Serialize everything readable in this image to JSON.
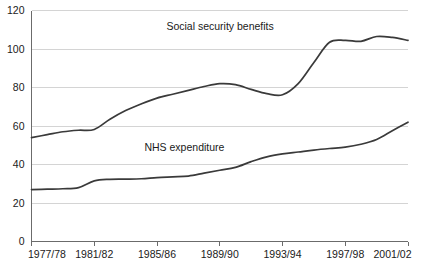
{
  "chart_data": {
    "type": "line",
    "title": "",
    "subtitle": "",
    "xlabel": "",
    "ylabel": "",
    "grid": "horizontal",
    "legend_position": "inline-annotation",
    "ylim": [
      0,
      120
    ],
    "yticks": [
      0,
      20,
      40,
      60,
      80,
      100,
      120
    ],
    "ytick_labels": [
      "0",
      "20",
      "40",
      "60",
      "80",
      "100",
      "120"
    ],
    "x": [
      "1977/78",
      "1978/79",
      "1979/80",
      "1980/81",
      "1981/82",
      "1982/83",
      "1983/84",
      "1984/85",
      "1985/86",
      "1986/87",
      "1987/88",
      "1988/89",
      "1989/90",
      "1990/91",
      "1991/92",
      "1992/93",
      "1993/94",
      "1994/95",
      "1995/96",
      "1996/97",
      "1997/98",
      "1998/99",
      "1999/00",
      "2000/01",
      "2001/02"
    ],
    "xtick_labels": [
      "1977/78",
      "1981/82",
      "1985/86",
      "1989/90",
      "1993/94",
      "1997/98",
      "2001/02"
    ],
    "xtick_indices": [
      0,
      4,
      8,
      12,
      16,
      20,
      24
    ],
    "series": [
      {
        "name": "Social security benefits",
        "label_x_index": 8.6,
        "label_y_value": 112,
        "color": "#3a3a3a",
        "values": [
          54,
          55.5,
          57,
          57.8,
          58.2,
          63.5,
          68,
          71.5,
          74.5,
          76.5,
          78.5,
          80.5,
          82,
          81.5,
          79,
          76.8,
          76.2,
          82,
          93,
          103.5,
          104.5,
          104,
          106.5,
          106,
          104.5
        ]
      },
      {
        "name": "NHS expenditure",
        "label_x_index": 7.2,
        "label_y_value": 49,
        "color": "#3a3a3a",
        "values": [
          27,
          27.2,
          27.4,
          28,
          31.5,
          32.3,
          32.4,
          32.6,
          33.2,
          33.6,
          34,
          35.5,
          37,
          38.5,
          41.5,
          44,
          45.5,
          46.5,
          47.5,
          48.3,
          49,
          50.5,
          53,
          57.5,
          62
        ]
      }
    ],
    "series_overrides": {
      "social_security_benefits_tail": [
        104.5,
        106,
        107,
        107.5,
        110.5
      ],
      "nhs_tail": [
        52,
        53.5,
        55.5,
        59.5,
        65
      ]
    }
  },
  "axis_labels": {
    "y": [
      "0",
      "20",
      "40",
      "60",
      "80",
      "100",
      "120"
    ],
    "x": [
      "1977/78",
      "1981/82",
      "1985/86",
      "1989/90",
      "1993/94",
      "1997/98",
      "2001/02"
    ]
  },
  "annotations": {
    "upper_series": "Social security benefits",
    "lower_series": "NHS expenditure"
  },
  "colors": {
    "line": "#3a3a3a",
    "grid": "#c9c9c9",
    "axis": "#6b6b6b",
    "text": "#1a1a1a",
    "background": "#ffffff"
  }
}
